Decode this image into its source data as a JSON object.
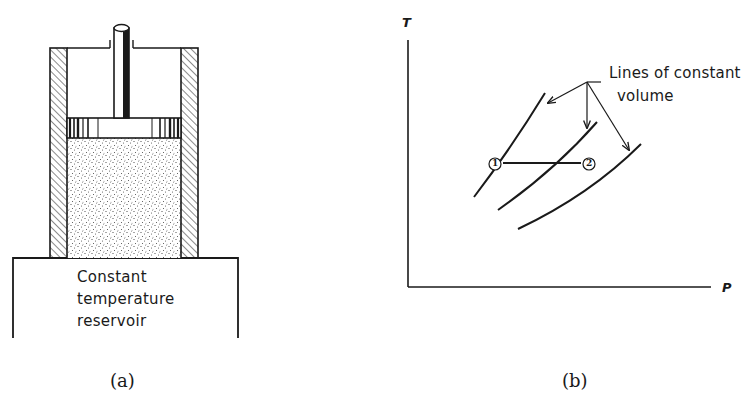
{
  "figure_a": {
    "caption": "(a)",
    "reservoir_label_lines": [
      "Constant",
      "temperature",
      "reservoir"
    ],
    "components": [
      "piston-rod",
      "piston",
      "cylinder-walls",
      "gas",
      "constant-temperature-reservoir"
    ]
  },
  "figure_b": {
    "caption": "(b)",
    "y_axis_label": "T",
    "x_axis_label": "P",
    "annotation_lines": [
      "Lines of constant",
      "volume"
    ],
    "state_labels": [
      "1",
      "2"
    ],
    "curves": [
      {
        "name": "constant-volume-line-1"
      },
      {
        "name": "constant-volume-line-2"
      },
      {
        "name": "constant-volume-line-3"
      }
    ],
    "process": {
      "from": "1",
      "to": "2",
      "type": "isothermal"
    }
  },
  "colors": {
    "ink": "#1a1a1a",
    "background": "#ffffff",
    "gas_fill": "#f2f2f2"
  }
}
